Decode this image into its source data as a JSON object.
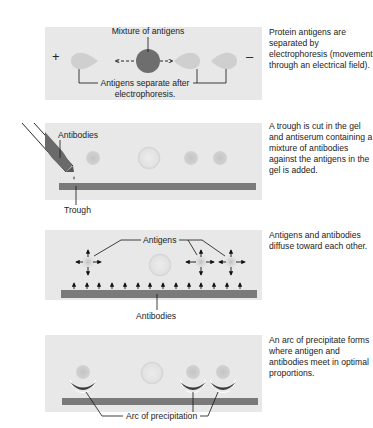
{
  "diagram": {
    "colors": {
      "gel": "#e8e8e8",
      "antigen_spot": "#c8c8c8",
      "mixture": "#707070",
      "trough": "#7a7a7a",
      "arc": "#3a3a3a",
      "text": "#222222"
    },
    "steps": [
      {
        "id": "step-1",
        "caption": "Protein antigens are separated by electrophoresis (movement through an electrical field).",
        "labels": {
          "mixture": "Mixture of antigens",
          "separate": "Antigens separate after",
          "separate_line2": "electrophoresis.",
          "plus": "+",
          "minus": "–"
        }
      },
      {
        "id": "step-2",
        "caption": "A trough is cut in the gel and antiserum containing a mixture of antibodies against the antigens in the gel is added.",
        "labels": {
          "antibodies": "Antibodies",
          "trough": "Trough"
        }
      },
      {
        "id": "step-3",
        "caption": "Antigens and antibodies diffuse toward each other.",
        "labels": {
          "antigens": "Antigens",
          "antibodies": "Antibodies"
        }
      },
      {
        "id": "step-4",
        "caption": "An arc of precipitate forms where antigen and antibodies meet in optimal proportions.",
        "labels": {
          "arc": "Arc of precipitation"
        }
      }
    ]
  }
}
